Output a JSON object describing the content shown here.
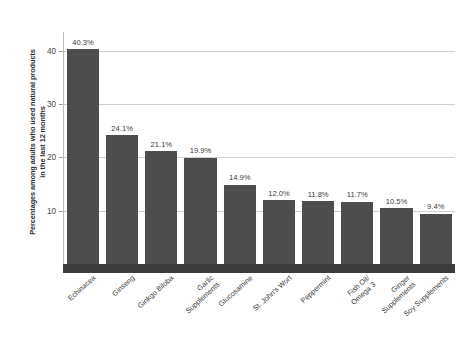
{
  "chart_data": {
    "type": "bar",
    "title": "",
    "xlabel": "",
    "ylabel": "Percentages among adults who used natural products\nin the last 12 months",
    "categories": [
      "Echinacea",
      "Ginseng",
      "Ginkgo Biloba",
      "Garlic\nSupplements",
      "Glucosamine",
      "St. John's Wort",
      "Peppermint",
      "Fish Oil/\nOmega 3",
      "Ginger\nSupplements",
      "Soy Supplements"
    ],
    "values": [
      40.3,
      24.1,
      21.1,
      19.9,
      14.9,
      12.0,
      11.8,
      11.7,
      10.5,
      9.4
    ],
    "data_labels": [
      "40.3%",
      "24.1%",
      "21.1%",
      "19.9%",
      "14.9%",
      "12.0%",
      "11.8%",
      "11.7%",
      "10.5%",
      "9.4%"
    ],
    "ylim": [
      0,
      43.5
    ],
    "yticks": [
      10,
      20,
      30,
      40
    ],
    "ytick_labels": [
      "10",
      "20",
      "30",
      "40"
    ],
    "grid": true,
    "legend": "none",
    "colors": {
      "bar": "#4d4d4d",
      "gridline": "#cfcfcf",
      "axis": "#b9b9b9",
      "baseline": "#3d3d3d",
      "text": "#3c3c3c",
      "background": "#ffffff"
    }
  }
}
